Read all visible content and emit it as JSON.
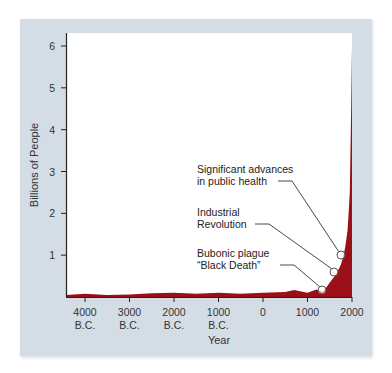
{
  "chart_data": {
    "type": "area",
    "title": "",
    "xlabel": "Year",
    "ylabel": "Billions of People",
    "ylim": [
      0,
      6.2
    ],
    "grid": false,
    "x_ticks": [
      {
        "line1": "4000",
        "line2": "B.C."
      },
      {
        "line1": "3000",
        "line2": "B.C."
      },
      {
        "line1": "2000",
        "line2": "B.C."
      },
      {
        "line1": "1000",
        "line2": "B.C."
      },
      {
        "line1": "0",
        "line2": ""
      },
      {
        "line1": "1000",
        "line2": ""
      },
      {
        "line1": "2000",
        "line2": ""
      }
    ],
    "y_ticks": [
      "1",
      "2",
      "3",
      "4",
      "5",
      "6"
    ],
    "series": [
      {
        "name": "World population",
        "color": "#9b1018",
        "x": [
          -4500,
          -4000,
          -3500,
          -3000,
          -2500,
          -2000,
          -1500,
          -1000,
          -500,
          0,
          500,
          700,
          1000,
          1200,
          1350,
          1500,
          1650,
          1750,
          1800,
          1850,
          1900,
          1950,
          1980,
          2000
        ],
        "values": [
          0.05,
          0.08,
          0.05,
          0.06,
          0.09,
          0.1,
          0.08,
          0.1,
          0.08,
          0.1,
          0.12,
          0.17,
          0.1,
          0.18,
          0.12,
          0.35,
          0.55,
          0.78,
          0.95,
          1.2,
          1.6,
          2.5,
          4.4,
          6.0
        ]
      }
    ],
    "annotations": [
      {
        "line1": "Significant advances",
        "line2": "in public health",
        "x": 1750,
        "y": 0.85
      },
      {
        "line1": "Industrial",
        "line2": "Revolution",
        "x": 1650,
        "y": 0.55
      },
      {
        "line1": "Bubonic plague",
        "line2": "“Black Death”",
        "x": 1350,
        "y": 0.12
      }
    ]
  }
}
